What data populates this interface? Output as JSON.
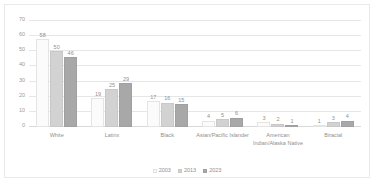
{
  "chart_data": {
    "type": "bar",
    "title": "",
    "xlabel": "",
    "ylabel": "",
    "ylim": [
      0,
      70
    ],
    "yticks": [
      0,
      10,
      20,
      30,
      40,
      50,
      60,
      70
    ],
    "grid": true,
    "legend_position": "bottom-center",
    "categories": [
      "White",
      "Latinx",
      "Black",
      "Asian/Pacific Islander",
      "American Indian/Alaska Native",
      "Biracial"
    ],
    "series": [
      {
        "name": "2003",
        "color": "#fbfbfb",
        "values": [
          58,
          19,
          17,
          4,
          3,
          1
        ]
      },
      {
        "name": "2013",
        "color": "#d2d2d2",
        "values": [
          50,
          25,
          16,
          5,
          2,
          3
        ]
      },
      {
        "name": "2023",
        "color": "#a8a8a8",
        "values": [
          46,
          29,
          15,
          6,
          1,
          4
        ]
      }
    ]
  }
}
